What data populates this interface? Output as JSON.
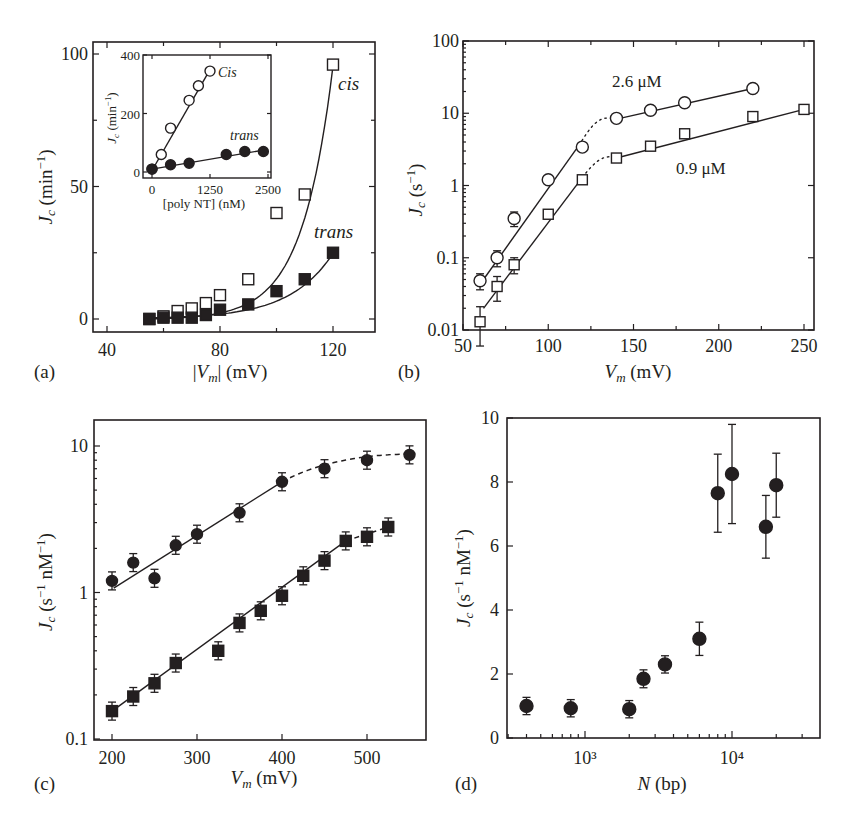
{
  "figure": {
    "panels": [
      {
        "id": "a",
        "label": "(a)"
      },
      {
        "id": "b",
        "label": "(b)"
      },
      {
        "id": "c",
        "label": "(c)"
      },
      {
        "id": "d",
        "label": "(d)"
      }
    ]
  },
  "chart_data": [
    {
      "panel": "(a)",
      "type": "scatter",
      "title": "",
      "xlabel": "|V_m| (mV)",
      "ylabel": "J_c (min^-1)",
      "xlim": [
        35,
        135
      ],
      "ylim": [
        -5,
        105
      ],
      "xticks": [
        40,
        80,
        120
      ],
      "yticks": [
        0,
        50,
        100
      ],
      "grid": false,
      "annotations": [
        "cis",
        "trans"
      ],
      "series": [
        {
          "name": "cis",
          "marker": "open-square",
          "x": [
            55,
            60,
            65,
            70,
            75,
            80,
            90,
            100,
            110,
            120
          ],
          "y": [
            0,
            1,
            3,
            4,
            6,
            9,
            15,
            40,
            47,
            96
          ]
        },
        {
          "name": "trans",
          "marker": "filled-square",
          "x": [
            55,
            60,
            65,
            70,
            75,
            80,
            90,
            100,
            110,
            120
          ],
          "y": [
            0,
            0.5,
            0.5,
            0.5,
            1.5,
            3.5,
            5.5,
            10.5,
            15,
            25
          ]
        }
      ],
      "inset": {
        "type": "scatter",
        "xlabel": "[poly NT] (nM)",
        "ylabel": "J_c (min^-1)",
        "xlim": [
          -150,
          2650
        ],
        "ylim": [
          -20,
          400
        ],
        "xticks": [
          0,
          1250,
          2500
        ],
        "yticks": [
          0,
          200,
          400
        ],
        "annotations": [
          "Cis",
          "trans"
        ],
        "series": [
          {
            "name": "Cis",
            "marker": "open-circle",
            "x": [
              0,
              200,
              400,
              800,
              1000,
              1250
            ],
            "y": [
              10,
              60,
              150,
              245,
              295,
              345
            ]
          },
          {
            "name": "trans",
            "marker": "filled-circle",
            "x": [
              0,
              400,
              800,
              1600,
              2000,
              2400
            ],
            "y": [
              10,
              25,
              30,
              60,
              70,
              70
            ]
          }
        ]
      }
    },
    {
      "panel": "(b)",
      "type": "scatter",
      "title": "",
      "xlabel": "V_m (mV)",
      "ylabel": "J_c (s^-1)",
      "xscale": "linear",
      "yscale": "log",
      "xlim": [
        50,
        255
      ],
      "ylim": [
        0.01,
        100
      ],
      "xticks": [
        50,
        100,
        150,
        200,
        250
      ],
      "yticks": [
        0.01,
        0.1,
        1,
        10,
        100
      ],
      "ytick_labels": [
        "0.01",
        "0.1",
        "1",
        "10",
        "100"
      ],
      "grid": false,
      "annotations": [
        "2.6 μM",
        "0.9 μM"
      ],
      "series": [
        {
          "name": "2.6 μM",
          "marker": "open-circle",
          "x": [
            60,
            70,
            80,
            100,
            120,
            140,
            160,
            180,
            220
          ],
          "y": [
            0.048,
            0.1,
            0.35,
            1.2,
            3.4,
            8.5,
            11,
            14,
            22
          ],
          "yerr": [
            0.012,
            0.025,
            0.08,
            0,
            0,
            0,
            0,
            0,
            0
          ]
        },
        {
          "name": "0.9 μM",
          "marker": "open-square",
          "x": [
            60,
            70,
            80,
            100,
            120,
            140,
            160,
            180,
            220,
            250
          ],
          "y": [
            0.013,
            0.04,
            0.08,
            0.4,
            1.2,
            2.4,
            3.5,
            5.2,
            9,
            11.3
          ],
          "yerr": [
            0.008,
            0.015,
            0.02,
            0,
            0,
            0,
            0,
            0,
            0,
            0
          ]
        }
      ]
    },
    {
      "panel": "(c)",
      "type": "scatter",
      "title": "",
      "xlabel": "V_m (mV)",
      "ylabel": "J_c (s^-1 nM^-1)",
      "xscale": "linear",
      "yscale": "log",
      "xlim": [
        180,
        555
      ],
      "ylim": [
        0.1,
        15
      ],
      "xticks": [
        200,
        300,
        400,
        500
      ],
      "yticks": [
        0.1,
        1,
        10
      ],
      "ytick_labels": [
        "0.1",
        "1",
        "10"
      ],
      "grid": false,
      "series": [
        {
          "name": "circles",
          "marker": "filled-circle",
          "x": [
            200,
            225,
            250,
            275,
            300,
            350,
            400,
            450,
            500,
            550
          ],
          "y": [
            1.2,
            1.6,
            1.25,
            2.1,
            2.5,
            3.5,
            5.7,
            7.0,
            8.0,
            8.7
          ]
        },
        {
          "name": "squares",
          "marker": "filled-square",
          "x": [
            200,
            225,
            250,
            275,
            325,
            350,
            375,
            400,
            425,
            450,
            475,
            500,
            525
          ],
          "y": [
            0.155,
            0.195,
            0.24,
            0.33,
            0.4,
            0.62,
            0.75,
            0.95,
            1.3,
            1.65,
            2.25,
            2.4,
            2.8
          ]
        }
      ]
    },
    {
      "panel": "(d)",
      "type": "scatter",
      "title": "",
      "xlabel": "N (bp)",
      "ylabel": "J_c (s^-1 nM^-1)",
      "xscale": "log",
      "yscale": "linear",
      "xlim": [
        300,
        45000
      ],
      "ylim": [
        0,
        10
      ],
      "xticks": [
        1000,
        10000
      ],
      "xtick_labels": [
        "10³",
        "10⁴"
      ],
      "yticks": [
        0,
        2,
        4,
        6,
        8,
        10
      ],
      "grid": false,
      "series": [
        {
          "name": "data",
          "marker": "filled-circle",
          "x": [
            400,
            800,
            2000,
            2500,
            3500,
            6000,
            8000,
            10000,
            17000,
            20000
          ],
          "y": [
            1.0,
            0.93,
            0.9,
            1.85,
            2.3,
            3.1,
            7.65,
            8.25,
            6.6,
            7.9
          ],
          "yerr": [
            0.27,
            0.27,
            0.27,
            0.28,
            0.27,
            0.52,
            1.22,
            1.55,
            0.98,
            1.0
          ]
        }
      ]
    }
  ]
}
